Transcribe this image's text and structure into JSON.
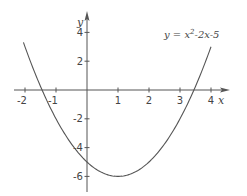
{
  "chart_data": {
    "type": "line",
    "title": "",
    "equation_label": {
      "prefix": "y = ",
      "base": "x",
      "exponent": "2",
      "rest": "-2x-5"
    },
    "function": {
      "a": 1,
      "b": -2,
      "c": -5
    },
    "xlabel": "x",
    "ylabel": "y",
    "xlim": [
      -2.05,
      4.0
    ],
    "ylim": [
      -6,
      4
    ],
    "x_ticks": [
      -2,
      -1,
      1,
      2,
      3,
      4
    ],
    "x_tick_labels": [
      "-2",
      "-1",
      "1",
      "2",
      "3",
      "4"
    ],
    "y_ticks": [
      4,
      2,
      -2,
      -4,
      -6
    ],
    "y_tick_labels": [
      "4",
      "2",
      "-2",
      "-4",
      "-6"
    ],
    "grid": false,
    "legend": "none",
    "series": [
      {
        "name": "y = x^2 - 2x - 5",
        "x": [
          -2,
          -1.5,
          -1,
          -0.5,
          0,
          0.5,
          1,
          1.5,
          2,
          2.5,
          3,
          3.5,
          4
        ],
        "values": [
          3,
          -0.75,
          -2,
          -3.75,
          -5,
          -5.75,
          -6,
          -5.75,
          -5,
          -3.75,
          -2,
          0.25,
          3
        ]
      }
    ],
    "colors": {
      "axis": "#555555",
      "curve": "#555555",
      "text": "#444444"
    }
  }
}
